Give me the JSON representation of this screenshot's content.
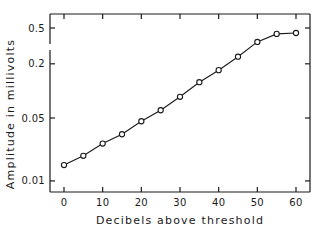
{
  "chart_data": {
    "type": "line",
    "title": "",
    "xlabel": "Decibels above threshold",
    "ylabel": "Amplitude in millivolts",
    "xscale": "linear",
    "yscale": "log",
    "xlim": [
      -3,
      64
    ],
    "ylim": [
      0.0075,
      0.6
    ],
    "grid": false,
    "legend": null,
    "x_ticks": [
      0,
      10,
      20,
      30,
      40,
      50,
      60
    ],
    "x_tick_labels": [
      "0",
      "10",
      "20",
      "30",
      "40",
      "50",
      "60"
    ],
    "y_ticks": [
      0.01,
      0.05,
      0.2,
      0.5
    ],
    "y_tick_labels": [
      "0.01",
      "0.05",
      "0.2",
      "0.5"
    ],
    "marker": "open-circle",
    "series": [
      {
        "name": "Amplitude",
        "x": [
          0,
          5,
          10,
          15,
          20,
          25,
          30,
          35,
          40,
          45,
          50,
          55,
          60
        ],
        "y": [
          0.015,
          0.019,
          0.026,
          0.033,
          0.046,
          0.061,
          0.086,
          0.125,
          0.17,
          0.24,
          0.35,
          0.43,
          0.44
        ]
      }
    ]
  },
  "colors": {
    "ink": "#1a1a1a",
    "background": "#ffffff"
  }
}
